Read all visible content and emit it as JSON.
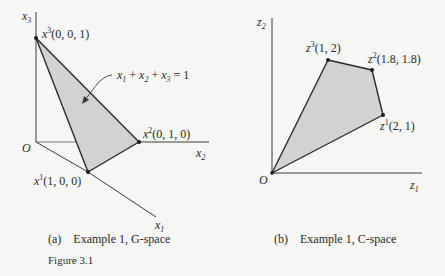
{
  "figure": {
    "label": "Figure 3.1",
    "panels": [
      {
        "id": "a",
        "caption": "(a)    Example 1, G-space",
        "axes": {
          "vertical": "x3",
          "horizontal": "x2",
          "diagonal": "x1",
          "origin": "O"
        },
        "vertices": [
          {
            "name": "x1",
            "coords": "(1, 0, 0)"
          },
          {
            "name": "x2",
            "coords": "(0, 1, 0)"
          },
          {
            "name": "x3",
            "coords": "(0, 0, 1)"
          }
        ],
        "annotation": "x1 + x2 + x3 = 1"
      },
      {
        "id": "b",
        "caption": "(b)    Example 1, C-space",
        "axes": {
          "vertical": "z2",
          "horizontal": "z1",
          "origin": "O"
        },
        "vertices": [
          {
            "name": "z1",
            "coords": "(2, 1)"
          },
          {
            "name": "z2",
            "coords": "(1.8, 1.8)"
          },
          {
            "name": "z3",
            "coords": "(1, 2)"
          }
        ]
      }
    ]
  },
  "colors": {
    "fill": "#d2d2d0",
    "stroke": "#2a2a2a",
    "background": "#f6f6f4"
  }
}
